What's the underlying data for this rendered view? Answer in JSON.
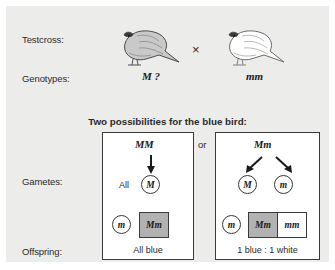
{
  "figure": {
    "rows": {
      "testcross_label": "Testcross:",
      "genotypes_label": "Genotypes:",
      "gametes_label": "Gametes:",
      "offspring_label": "Offspring:"
    },
    "cross_symbol": "×",
    "parents": {
      "blue_bird": {
        "genotype": "M ?",
        "phenotype": "blue",
        "shading": "gray"
      },
      "white_bird": {
        "genotype": "mm",
        "phenotype": "white",
        "shading": "white"
      }
    },
    "heading": "Two possibilities for the blue bird:",
    "or_connector": "or",
    "possibility_left": {
      "parent_genotype": "MM",
      "gamete_prefix": "All",
      "gametes": [
        "M"
      ],
      "other_parent_gamete": "m",
      "offspring_cells": [
        {
          "genotype": "Mm",
          "phenotype": "blue"
        }
      ],
      "result": "All blue"
    },
    "possibility_right": {
      "parent_genotype": "Mm",
      "gametes": [
        "M",
        "m"
      ],
      "other_parent_gamete": "m",
      "offspring_cells": [
        {
          "genotype": "Mm",
          "phenotype": "blue"
        },
        {
          "genotype": "mm",
          "phenotype": "white"
        }
      ],
      "result": "1 blue : 1 white"
    },
    "colors": {
      "background": "#ececea",
      "blue_allele_fill": "#b2b2b2",
      "white_allele_fill": "#ffffff",
      "stroke": "#3a3a3a",
      "text": "#2b2b2b"
    }
  }
}
